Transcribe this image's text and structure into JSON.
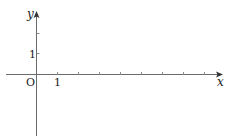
{
  "diagram": {
    "type": "coordinate-plane",
    "x_axis_label": "x",
    "y_axis_label": "y",
    "origin_label": "O",
    "x_unit_label": "1",
    "y_unit_label": "1",
    "colors": {
      "axis": "#6b6b6b",
      "text": "#222222",
      "background": "#ffffff"
    }
  }
}
